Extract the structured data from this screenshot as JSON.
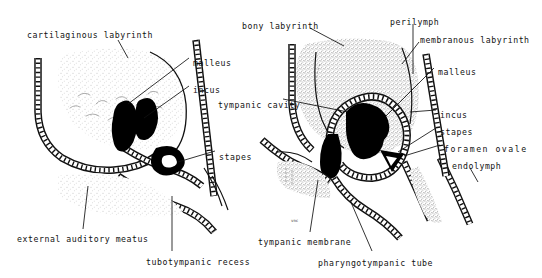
{
  "figure": {
    "background_color": "#ffffff",
    "ink_color": "#121212",
    "stipple_color": "#b9b9b9",
    "solid_fill_color": "#000000"
  },
  "panels": [
    {
      "id": "left-panel",
      "name": "earlier-stage",
      "labels": [
        {
          "id": "cartilaginous-labyrinth",
          "text": "cartilaginous labyrinth",
          "x": 27,
          "y": 31,
          "leader": [
            [
              118,
              40
            ],
            [
              128,
              58
            ]
          ]
        },
        {
          "id": "malleus",
          "text": "malleus",
          "x": 193,
          "y": 59,
          "leader": [
            [
              189,
              58
            ],
            [
              128,
              104
            ]
          ]
        },
        {
          "id": "incus",
          "text": "incus",
          "x": 193,
          "y": 86,
          "leader": [
            [
              189,
              86
            ],
            [
              144,
              118
            ]
          ]
        },
        {
          "id": "stapes",
          "text": "stapes",
          "x": 219,
          "y": 153,
          "leader": [
            [
              215,
              151
            ],
            [
              178,
              166
            ]
          ]
        },
        {
          "id": "external-auditory-meatus",
          "text": "external auditory meatus",
          "x": 17,
          "y": 235,
          "leader": [
            [
              83,
              229
            ],
            [
              88,
              203
            ]
          ]
        },
        {
          "id": "tubotympanic-recess",
          "text": "tubotympanic recess",
          "x": 146,
          "y": 258,
          "leader": [
            [
              172,
              251
            ],
            [
              170,
              200
            ]
          ]
        }
      ]
    },
    {
      "id": "right-panel",
      "name": "later-stage",
      "labels": [
        {
          "id": "bony-labyrinth",
          "text": "bony labyrinth",
          "x": 242,
          "y": 22,
          "leader": [
            [
              310,
              28
            ],
            [
              342,
              44
            ]
          ]
        },
        {
          "id": "perilymph",
          "text": "perilymph",
          "x": 390,
          "y": 18,
          "leader": [
            [
              413,
              22
            ],
            [
              413,
              73
            ]
          ]
        },
        {
          "id": "membranous-labyrinth",
          "text": "membranous labyrinth",
          "x": 420,
          "y": 36,
          "leader": [
            [
              418,
              40
            ],
            [
              400,
              64
            ]
          ]
        },
        {
          "id": "tympanic-cavity",
          "text": "tympanic cavity",
          "x": 218,
          "y": 101,
          "leader": [
            [
              283,
              99
            ],
            [
              345,
              111
            ]
          ]
        },
        {
          "id": "malleus-r",
          "text": "malleus",
          "x": 438,
          "y": 68,
          "leader": [
            [
              434,
              68
            ],
            [
              386,
              116
            ]
          ]
        },
        {
          "id": "incus-r",
          "text": "incus",
          "x": 440,
          "y": 111,
          "leader": [
            [
              436,
              110
            ],
            [
              404,
              112
            ]
          ]
        },
        {
          "id": "stapes-r",
          "text": "stapes",
          "x": 440,
          "y": 128,
          "leader": [
            [
              436,
              128
            ],
            [
              400,
              152
            ]
          ]
        },
        {
          "id": "foramen-ovale",
          "text": "foramen ovale",
          "x": 444,
          "y": 145,
          "leader": [
            [
              440,
              145
            ],
            [
              404,
              156
            ]
          ]
        },
        {
          "id": "endolymph",
          "text": "endolymph",
          "x": 452,
          "y": 162,
          "leader": [
            [
              470,
              168
            ],
            [
              478,
              180
            ]
          ]
        },
        {
          "id": "tympanic-membrane",
          "text": "tympanic membrane",
          "x": 258,
          "y": 238,
          "leader": [
            [
              310,
              232
            ],
            [
              318,
              185
            ]
          ]
        },
        {
          "id": "pharyngotympanic-tube",
          "text": "pharyngotympanic tube",
          "x": 318,
          "y": 259,
          "leader": [
            [
              372,
              251
            ],
            [
              350,
              200
            ]
          ]
        },
        {
          "id": "small-mark",
          "text": "vnc",
          "x": 291,
          "y": 219,
          "leader": null
        }
      ]
    }
  ]
}
